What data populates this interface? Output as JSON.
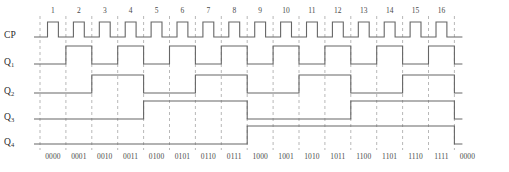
{
  "diagram": {
    "type": "timing-diagram",
    "colors": {
      "wave": "#666666",
      "grid": "#9a9a9a",
      "text": "#3a3a3a",
      "background": "#ffffff"
    },
    "geometry": {
      "x_start": 40,
      "x_end": 478,
      "cycles": 16,
      "period_px": 25.9,
      "clock_duty": 0.42,
      "rows": [
        {
          "name": "CP",
          "baseline": 37,
          "high": 22
        },
        {
          "name": "Q1",
          "baseline": 64,
          "high": 46
        },
        {
          "name": "Q2",
          "baseline": 93,
          "high": 75
        },
        {
          "name": "Q3",
          "baseline": 119,
          "high": 101
        },
        {
          "name": "Q4",
          "baseline": 144,
          "high": 126
        }
      ]
    }
  },
  "signals": [
    {
      "key": "cp",
      "label": "CP",
      "sub": "",
      "divider": 1,
      "kind": "clock"
    },
    {
      "key": "q1",
      "label": "Q",
      "sub": "1",
      "divider": 2,
      "kind": "toggle"
    },
    {
      "key": "q2",
      "label": "Q",
      "sub": "2",
      "divider": 4,
      "kind": "toggle"
    },
    {
      "key": "q3",
      "label": "Q",
      "sub": "3",
      "divider": 8,
      "kind": "toggle"
    },
    {
      "key": "q4",
      "label": "Q",
      "sub": "4",
      "divider": 16,
      "kind": "toggle"
    }
  ],
  "clock_numbers": [
    "1",
    "2",
    "3",
    "4",
    "5",
    "6",
    "7",
    "8",
    "9",
    "10",
    "11",
    "12",
    "13",
    "14",
    "15",
    "16"
  ],
  "state_labels": [
    "0000",
    "0001",
    "0010",
    "0011",
    "0100",
    "0101",
    "0110",
    "0111",
    "1000",
    "1001",
    "1010",
    "1011",
    "1100",
    "1101",
    "1110",
    "1111",
    "0000"
  ],
  "chart_data": {
    "type": "line",
    "xlabel": "",
    "ylabel": "",
    "x": [
      0,
      1,
      2,
      3,
      4,
      5,
      6,
      7,
      8,
      9,
      10,
      11,
      12,
      13,
      14,
      15,
      16
    ],
    "series": [
      {
        "name": "CP",
        "values": [
          0,
          0,
          0,
          0,
          0,
          0,
          0,
          0,
          0,
          0,
          0,
          0,
          0,
          0,
          0,
          0,
          0
        ],
        "note": "clock: one positive pulse per interval, 16 pulses"
      },
      {
        "name": "Q1",
        "values": [
          0,
          1,
          0,
          1,
          0,
          1,
          0,
          1,
          0,
          1,
          0,
          1,
          0,
          1,
          0,
          1,
          0
        ]
      },
      {
        "name": "Q2",
        "values": [
          0,
          0,
          1,
          1,
          0,
          0,
          1,
          1,
          0,
          0,
          1,
          1,
          0,
          0,
          1,
          1,
          0
        ]
      },
      {
        "name": "Q3",
        "values": [
          0,
          0,
          0,
          0,
          1,
          1,
          1,
          1,
          0,
          0,
          0,
          0,
          1,
          1,
          1,
          1,
          0
        ]
      },
      {
        "name": "Q4",
        "values": [
          0,
          0,
          0,
          0,
          0,
          0,
          0,
          0,
          1,
          1,
          1,
          1,
          1,
          1,
          1,
          1,
          0
        ]
      }
    ],
    "xticklabels": [
      "0000",
      "0001",
      "0010",
      "0011",
      "0100",
      "0101",
      "0110",
      "0111",
      "1000",
      "1001",
      "1010",
      "1011",
      "1100",
      "1101",
      "1110",
      "1111",
      "0000"
    ],
    "grid": true,
    "legend": "none"
  }
}
